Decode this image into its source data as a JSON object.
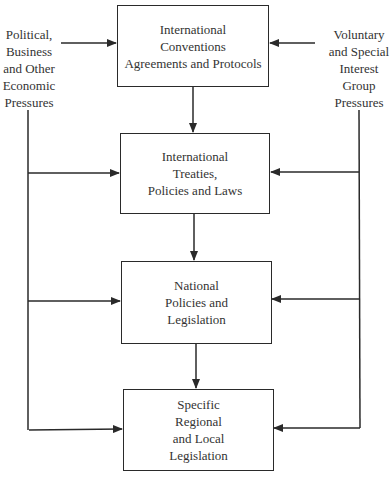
{
  "diagram": {
    "boxes": [
      {
        "id": "international-conventions",
        "label": "International\nConventions\nAgreements and Protocols"
      },
      {
        "id": "international-treaties",
        "label": "International\nTreaties,\nPolicies and Laws"
      },
      {
        "id": "national-policies",
        "label": "National\nPolicies and\nLegislation"
      },
      {
        "id": "regional-local",
        "label": "Specific\nRegional\nand Local\nLegislation"
      }
    ],
    "left_source": {
      "label": "Political,\nBusiness\nand Other\nEconomic\nPressures"
    },
    "right_source": {
      "label": "Voluntary\nand Special\nInterest\nGroup\nPressures"
    },
    "edges": [
      {
        "from": "left_source",
        "to": "international-conventions"
      },
      {
        "from": "right_source",
        "to": "international-conventions"
      },
      {
        "from": "international-conventions",
        "to": "international-treaties"
      },
      {
        "from": "international-treaties",
        "to": "national-policies"
      },
      {
        "from": "national-policies",
        "to": "regional-local"
      },
      {
        "from": "left_source",
        "to": "international-treaties"
      },
      {
        "from": "left_source",
        "to": "national-policies"
      },
      {
        "from": "left_source",
        "to": "regional-local"
      },
      {
        "from": "right_source",
        "to": "international-treaties"
      },
      {
        "from": "right_source",
        "to": "national-policies"
      },
      {
        "from": "right_source",
        "to": "regional-local"
      }
    ],
    "line_color": "#2a2a2a"
  }
}
